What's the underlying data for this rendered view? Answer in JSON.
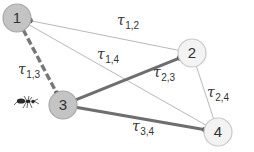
{
  "diagram": {
    "type": "ant-colony-graph",
    "nodes": [
      {
        "id": "1",
        "label": "1",
        "x": 17,
        "y": 18,
        "r": 14,
        "fill": "#c4c4c4",
        "stroke": "#a8a8a8"
      },
      {
        "id": "2",
        "label": "2",
        "x": 192,
        "y": 53,
        "r": 14,
        "fill": "#f3f3f3",
        "stroke": "#c8c8c8"
      },
      {
        "id": "3",
        "label": "3",
        "x": 63,
        "y": 105,
        "r": 14,
        "fill": "#c4c4c4",
        "stroke": "#a8a8a8"
      },
      {
        "id": "4",
        "label": "4",
        "x": 218,
        "y": 132,
        "r": 14,
        "fill": "#f3f3f3",
        "stroke": "#c8c8c8"
      }
    ],
    "edges": [
      {
        "from": "1",
        "to": "2",
        "style": "thin",
        "symbol": "τ",
        "sub": "1,2",
        "lx": 117,
        "ly": 25
      },
      {
        "from": "1",
        "to": "4",
        "style": "thin",
        "symbol": "τ",
        "sub": "1,4",
        "lx": 97,
        "ly": 59
      },
      {
        "from": "1",
        "to": "3",
        "style": "dashed",
        "symbol": "τ",
        "sub": "1,3",
        "lx": 18,
        "ly": 74
      },
      {
        "from": "3",
        "to": "2",
        "style": "thick",
        "symbol": "τ",
        "sub": "2,3",
        "lx": 153,
        "ly": 77
      },
      {
        "from": "2",
        "to": "4",
        "style": "thin",
        "symbol": "τ",
        "sub": "2,4",
        "lx": 207,
        "ly": 97
      },
      {
        "from": "3",
        "to": "4",
        "style": "thick",
        "symbol": "τ",
        "sub": "3,4",
        "lx": 132,
        "ly": 131
      }
    ],
    "ant": {
      "x": 28,
      "y": 101,
      "near_node": "3"
    },
    "colors": {
      "thin_edge": "#b0b0b0",
      "thick_edge": "#6e6e6e",
      "dashed_edge": "#777777",
      "endpoint_dot": "#5a5a5a",
      "ant": "#2a2a2a"
    }
  }
}
